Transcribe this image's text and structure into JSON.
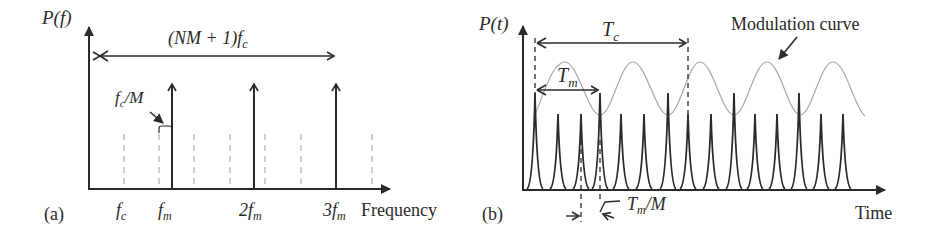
{
  "panel_a": {
    "tag": "(a)",
    "y_label": "P(f)",
    "x_label": "Frequency",
    "span_label": "(NM + 1)f",
    "span_label_sub": "c",
    "spacing_label": "f",
    "spacing_label_sub": "c",
    "spacing_label_tail": "/M",
    "ticks": [
      {
        "main": "f",
        "sub": "c"
      },
      {
        "main": "f",
        "sub": "m"
      },
      {
        "main": "2f",
        "sub": "m"
      },
      {
        "main": "3f",
        "sub": "m"
      }
    ]
  },
  "panel_b": {
    "tag": "(b)",
    "y_label": "P(t)",
    "x_label": "Time",
    "period_c_label": "T",
    "period_c_sub": "c",
    "period_m_label": "T",
    "period_m_sub": "m",
    "shift_label": "T",
    "shift_sub": "m",
    "shift_tail": "/M",
    "curve_label": "Modulation curve"
  },
  "colors": {
    "ink": "#2a2a2a",
    "dashed": "#b0b0b0",
    "curve": "#a8a8a8"
  }
}
